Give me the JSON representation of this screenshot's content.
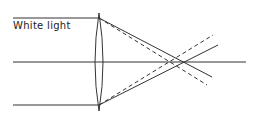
{
  "diagram": {
    "label": "White light",
    "colors": {
      "line": "#333333",
      "background": "#ffffff"
    },
    "incoming_rays": [
      {
        "y": 18,
        "x_start": 13,
        "x_end": 99
      },
      {
        "y": 105,
        "x_start": 13,
        "x_end": 99
      }
    ],
    "optical_axis": {
      "y": 62,
      "x_start": 13,
      "x_end": 246
    },
    "lens": {
      "center_x": 99,
      "top_y": 13,
      "bottom_y": 111
    },
    "focus_solid": {
      "x": 182,
      "y": 62
    },
    "focus_dashed": {
      "x": 171,
      "y": 62
    }
  }
}
